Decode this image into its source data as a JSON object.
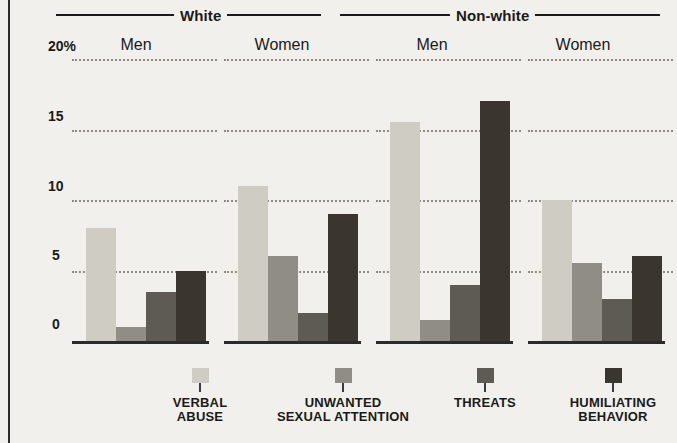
{
  "chart_data": {
    "type": "bar",
    "title": "",
    "xlabel": "",
    "ylabel": "",
    "ylim": [
      0,
      20
    ],
    "yticks": [
      {
        "value": 20,
        "label": "20%"
      },
      {
        "value": 15,
        "label": "15"
      },
      {
        "value": 10,
        "label": "10"
      },
      {
        "value": 5,
        "label": "5"
      },
      {
        "value": 0,
        "label": "0"
      }
    ],
    "grid": "dotted horizontal gridlines",
    "legend_position": "bottom",
    "supergroups": [
      {
        "label": "White",
        "subgroups": [
          "Men",
          "Women"
        ]
      },
      {
        "label": "Non-white",
        "subgroups": [
          "Men",
          "Women"
        ]
      }
    ],
    "categories": [
      "White Men",
      "White Women",
      "Non-white Men",
      "Non-white Women"
    ],
    "series": [
      {
        "name": "VERBAL\nABUSE",
        "color": "#cfccc3",
        "values": [
          8,
          11,
          15.5,
          10
        ]
      },
      {
        "name": "UNWANTED\nSEXUAL ATTENTION",
        "color": "#8f8d85",
        "values": [
          1,
          6,
          1.5,
          5.5
        ]
      },
      {
        "name": "THREATS",
        "color": "#5e5a54",
        "values": [
          3.5,
          2,
          4,
          3
        ]
      },
      {
        "name": "HUMILIATING\nBEHAVIOR",
        "color": "#3a352f",
        "values": [
          5,
          9,
          17,
          6
        ]
      }
    ]
  },
  "axis": {
    "tick_20": "20%",
    "tick_15": "15",
    "tick_10": "10",
    "tick_5": "5",
    "tick_0": "0"
  },
  "headers": {
    "white": "White",
    "nonwhite": "Non-white"
  },
  "sublabels": {
    "white_men": "Men",
    "white_women": "Women",
    "nonwhite_men": "Men",
    "nonwhite_women": "Women"
  },
  "legend": {
    "items": [
      {
        "label": "VERBAL\nABUSE",
        "color": "#cfccc3"
      },
      {
        "label": "UNWANTED\nSEXUAL ATTENTION",
        "color": "#8f8d85"
      },
      {
        "label": "THREATS",
        "color": "#5e5a54"
      },
      {
        "label": "HUMILIATING\nBEHAVIOR",
        "color": "#3a352f"
      }
    ]
  }
}
